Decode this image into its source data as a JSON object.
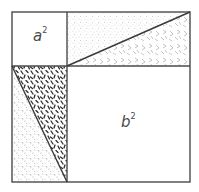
{
  "diagram": {
    "colors": {
      "stroke": "#4a4a4a",
      "background": "#ffffff",
      "stipple": "#9a9a9a",
      "dense_hatch": "#2e2e2e",
      "light_hatch": "#8a8a8a"
    },
    "outer_square": {
      "x": 12,
      "y": 12,
      "size_w": 178,
      "size_h": 170
    },
    "split": {
      "x": 67,
      "y": 66
    },
    "regions": [
      {
        "id": "a-squared",
        "label_base": "a",
        "label_exp": "2",
        "fill": "none"
      },
      {
        "id": "top-right-rect-upper-triangle",
        "fill": "stipple"
      },
      {
        "id": "top-right-rect-lower-triangle",
        "fill": "light-hatch"
      },
      {
        "id": "bottom-left-rect-upper-triangle",
        "fill": "dense-hatch"
      },
      {
        "id": "bottom-left-rect-lower-triangle",
        "fill": "stipple-hatch"
      },
      {
        "id": "b-squared",
        "label_base": "b",
        "label_exp": "2",
        "fill": "none"
      }
    ],
    "labels": {
      "a_base": "a",
      "a_exp": "2",
      "b_base": "b",
      "b_exp": "2"
    }
  }
}
